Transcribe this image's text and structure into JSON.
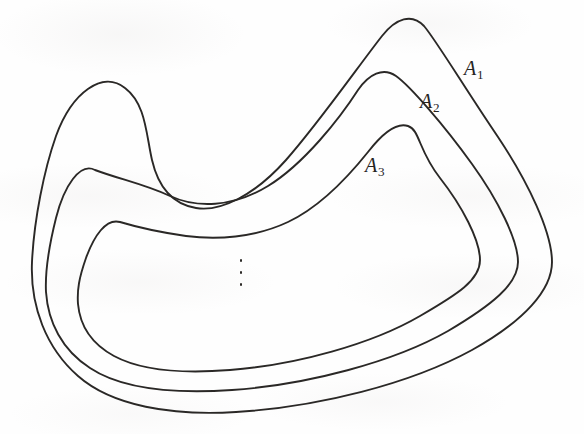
{
  "figure": {
    "kind": "nested-closed-curves-diagram",
    "background_color": "#fefefe",
    "stroke_color": "#2a2826",
    "stroke_width": 1.9,
    "width": 584,
    "height": 434
  },
  "labels": [
    {
      "id": "A1",
      "base": "A",
      "subscript": "1",
      "x": 464,
      "y": 58
    },
    {
      "id": "A2",
      "base": "A",
      "subscript": "2",
      "x": 420,
      "y": 91
    },
    {
      "id": "A3",
      "base": "A",
      "subscript": "3",
      "x": 365,
      "y": 155
    }
  ],
  "ellipsis": {
    "glyph": "vertical-ellipsis",
    "dots": 3,
    "x": 239,
    "y": 259
  },
  "curves": [
    {
      "id": "curve-A1",
      "label": "A1",
      "level": 1,
      "path": "M 125 88 C 103 70 72 92 56 136 C 44 170 34 220 32 262 C 30 306 46 348 78 376 C 112 406 172 416 236 412 C 318 407 410 384 472 350 C 524 321 552 290 552 262 C 552 232 528 182 498 137 C 466 90 436 40 424 26 C 412 13 396 18 382 36 C 360 64 318 124 286 160 C 254 196 220 212 196 208 C 172 204 158 186 152 160 C 146 134 146 104 125 88 Z"
    },
    {
      "id": "curve-A2",
      "label": "A2",
      "level": 2,
      "path": "M 95 170 C 80 162 64 186 56 218 C 48 250 45 272 46 292 C 48 322 62 350 90 368 C 120 388 172 394 232 390 C 306 385 394 362 448 331 C 492 305 518 284 518 262 C 518 240 498 200 472 164 C 444 125 410 86 396 76 C 383 67 369 74 358 90 C 340 118 304 164 268 186 C 232 208 196 208 170 196 C 144 184 122 180 95 170 Z"
    },
    {
      "id": "curve-A3",
      "label": "A3",
      "level": 3,
      "path": "M 120 222 C 106 218 94 236 86 258 C 79 278 77 290 78 304 C 80 326 92 344 114 356 C 140 370 180 374 230 370 C 296 365 372 344 420 316 C 458 294 480 280 480 260 C 480 240 462 206 440 178 C 418 150 420 130 408 126 C 396 122 382 134 368 152 C 352 172 322 206 288 222 C 254 238 216 240 186 236 C 158 232 140 228 120 222 Z"
    }
  ]
}
